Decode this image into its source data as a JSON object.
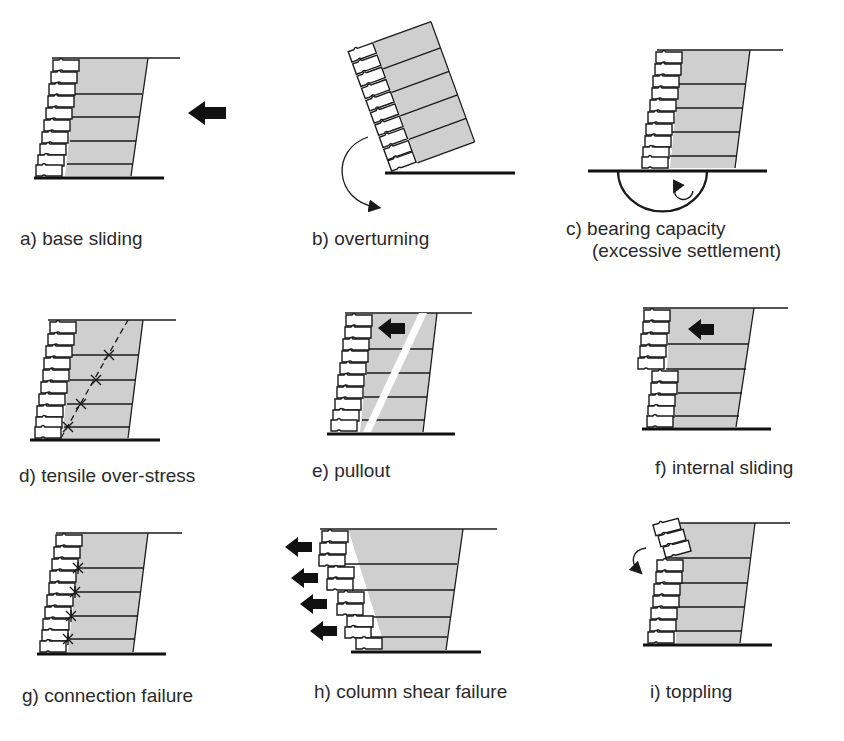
{
  "figure": {
    "colors": {
      "reinforced_fill": "#cfcfcf",
      "lines": "#1a1a1a",
      "background": "#ffffff",
      "text": "#2a2a2a"
    },
    "panels": [
      {
        "id": "a",
        "label": "a) base sliding",
        "mode": "external",
        "symbol": "arrow-left"
      },
      {
        "id": "b",
        "label": "b) overturning",
        "mode": "external",
        "symbol": "rotation-arrow"
      },
      {
        "id": "c",
        "label_line1": "c) bearing capacity",
        "label_line2": "(excessive settlement)",
        "mode": "external",
        "symbol": "semicircle-slip-rotation"
      },
      {
        "id": "d",
        "label": "d) tensile over-stress",
        "mode": "internal",
        "symbol": "dashed-failure-plane-x-marks"
      },
      {
        "id": "e",
        "label": "e) pullout",
        "mode": "internal",
        "symbol": "arrow-left-failure-plane"
      },
      {
        "id": "f",
        "label": "f) internal sliding",
        "mode": "internal",
        "symbol": "arrow-left"
      },
      {
        "id": "g",
        "label": "g) connection failure",
        "mode": "facing",
        "symbol": "x-marks-at-facing"
      },
      {
        "id": "h",
        "label": "h) column shear failure",
        "mode": "facing",
        "symbol": "four-arrows-left"
      },
      {
        "id": "i",
        "label": "i) toppling",
        "mode": "facing",
        "symbol": "rotation-arrow"
      }
    ]
  }
}
